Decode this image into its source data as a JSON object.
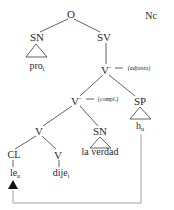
{
  "corner_label": "Nc",
  "nodes": {
    "root": "O",
    "subject_np": "SN",
    "vp": "SV",
    "v_double_bar": "V",
    "v_double_bar_mark": "\"",
    "adjunct_note": "→ (adjunto)",
    "v_bar": "V",
    "v_bar_mark": "\"",
    "complement_note": "→ (compl.)",
    "pp": "SP",
    "v_inner": "V",
    "object_np": "SN",
    "clitic": "CL",
    "verb_head": "V"
  },
  "terminals": {
    "pro": "pro",
    "pro_index": "i",
    "la_verdad": "la verdad",
    "h": "h",
    "h_index": "u",
    "le": "le",
    "le_index": "u",
    "dije": "dije",
    "dije_index": "i"
  },
  "colors": {
    "line": "#3a3a3a",
    "movement_line": "#8a8a8a",
    "text": "#2a2a2a"
  }
}
